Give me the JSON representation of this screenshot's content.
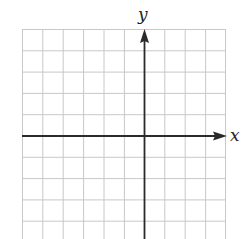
{
  "diagram": {
    "type": "coordinate-plane",
    "axes": {
      "x_label": "x",
      "y_label": "y",
      "x_arrow": "right",
      "y_arrow": "up"
    },
    "grid": {
      "columns": 10,
      "rows_visible": 10,
      "origin_column_index": 6,
      "origin_row_index": 5
    },
    "colors": {
      "grid_line": "#c8c8c8",
      "axis": "#2a2a2a",
      "background": "#ffffff"
    }
  }
}
